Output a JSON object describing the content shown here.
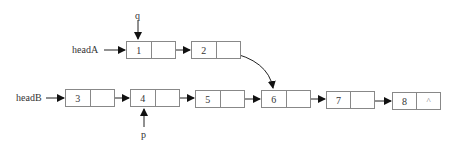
{
  "diagram": {
    "type": "linked-list-intersection",
    "labels": {
      "headA": "headA",
      "headB": "headB",
      "q": "q",
      "p": "p"
    },
    "listA": [
      {
        "value": "1",
        "next": ""
      },
      {
        "value": "2",
        "next": ""
      }
    ],
    "listB": [
      {
        "value": "3",
        "next": ""
      },
      {
        "value": "4",
        "next": ""
      },
      {
        "value": "5",
        "next": ""
      },
      {
        "value": "6",
        "next": ""
      },
      {
        "value": "7",
        "next": ""
      },
      {
        "value": "8",
        "next": "^"
      }
    ],
    "pointers": {
      "q_points_to": "1",
      "p_points_to": "4",
      "listA_joins_at": "6"
    },
    "colors": {
      "line": "#222222",
      "box_border": "#888888",
      "text": "#333333"
    }
  }
}
